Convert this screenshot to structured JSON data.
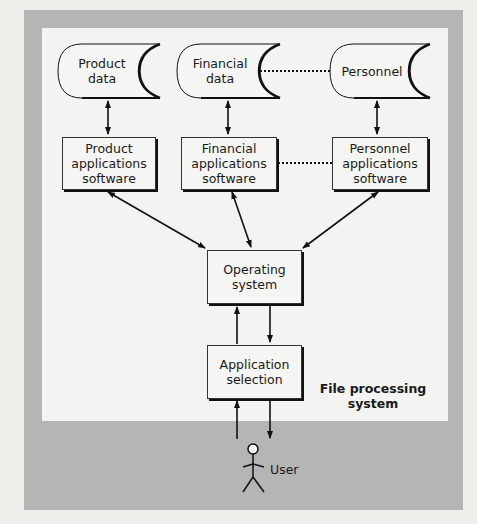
{
  "figure": {
    "header_partial": "Figure: File processing system",
    "caption_line1": "File processing",
    "caption_line2": "system"
  },
  "data_stores": [
    {
      "id": "product-data",
      "line1": "Product",
      "line2": "data"
    },
    {
      "id": "financial-data",
      "line1": "Financial",
      "line2": "data"
    },
    {
      "id": "personnel-data",
      "line1": "Personnel",
      "line2": ""
    }
  ],
  "applications": [
    {
      "id": "product-apps",
      "line1": "Product",
      "line2": "applications",
      "line3": "software"
    },
    {
      "id": "financial-apps",
      "line1": "Financial",
      "line2": "applications",
      "line3": "software"
    },
    {
      "id": "personnel-apps",
      "line1": "Personnel",
      "line2": "applications",
      "line3": "software"
    }
  ],
  "operating_system": {
    "line1": "Operating",
    "line2": "system"
  },
  "application_selection": {
    "line1": "Application",
    "line2": "selection"
  },
  "actor": {
    "label": "User"
  },
  "connections": [
    {
      "from": "Product data",
      "to": "Product applications software",
      "style": "bidirectional"
    },
    {
      "from": "Financial data",
      "to": "Financial applications software",
      "style": "bidirectional"
    },
    {
      "from": "Personnel",
      "to": "Personnel applications software",
      "style": "bidirectional"
    },
    {
      "from": "Financial data",
      "to": "Personnel",
      "style": "dotted"
    },
    {
      "from": "Financial applications software",
      "to": "Personnel applications software",
      "style": "dotted"
    },
    {
      "from": "Operating system",
      "to": "Product applications software",
      "style": "bidirectional"
    },
    {
      "from": "Operating system",
      "to": "Financial applications software",
      "style": "bidirectional"
    },
    {
      "from": "Operating system",
      "to": "Personnel applications software",
      "style": "bidirectional"
    },
    {
      "from": "Application selection",
      "to": "Operating system",
      "style": "arrow"
    },
    {
      "from": "Operating system",
      "to": "Application selection",
      "style": "arrow"
    },
    {
      "from": "User",
      "to": "Application selection",
      "style": "arrow"
    },
    {
      "from": "Application selection",
      "to": "User",
      "style": "arrow"
    }
  ],
  "colors": {
    "outer_frame": "#b5b5b3",
    "inner_panel": "#f3f3f1",
    "stroke": "#111111"
  }
}
